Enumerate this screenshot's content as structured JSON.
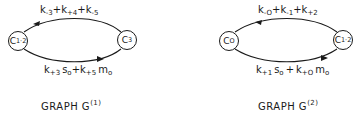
{
  "graphs": [
    {
      "id": "G1",
      "title": {
        "text": "GRAPH G",
        "superscript": "(1)"
      },
      "nodes": [
        {
          "base": "C",
          "subscript": "1·2"
        },
        {
          "base": "C",
          "subscript": "3"
        }
      ],
      "edges": [
        {
          "direction": "right-to-left",
          "position": "top",
          "terms": [
            {
              "k": "k",
              "sub": "-3",
              "suffix": "+"
            },
            {
              "k": "k",
              "sub": "+4",
              "suffix": "+"
            },
            {
              "k": "k",
              "sub": "-5",
              "suffix": ""
            }
          ]
        },
        {
          "direction": "left-to-right",
          "position": "bottom",
          "terms": [
            {
              "k": "k",
              "sub": "+3",
              "var": "s",
              "var_sub": "o",
              "suffix": "+"
            },
            {
              "k": "k",
              "sub": "+5",
              "var": "m",
              "var_sub": "o",
              "suffix": ""
            }
          ]
        }
      ]
    },
    {
      "id": "G2",
      "title": {
        "text": "GRAPH G",
        "superscript": "(2)"
      },
      "nodes": [
        {
          "base": "C",
          "subscript": "O"
        },
        {
          "base": "C",
          "subscript": "1·2"
        }
      ],
      "edges": [
        {
          "direction": "right-to-left",
          "position": "top",
          "terms": [
            {
              "k": "k",
              "sub": "-O",
              "suffix": "+"
            },
            {
              "k": "k",
              "sub": "-1",
              "suffix": "+"
            },
            {
              "k": "k",
              "sub": "+2",
              "suffix": ""
            }
          ]
        },
        {
          "direction": "left-to-right",
          "position": "bottom",
          "terms": [
            {
              "k": "k",
              "sub": "+1",
              "var": "s",
              "var_sub": "o",
              "suffix": "+"
            },
            {
              "k": "k",
              "sub": "+O",
              "var": "m",
              "var_sub": "o",
              "suffix": ""
            }
          ]
        }
      ]
    }
  ],
  "colors": {
    "ink": "#1a1a1a",
    "background": "#ffffff"
  }
}
